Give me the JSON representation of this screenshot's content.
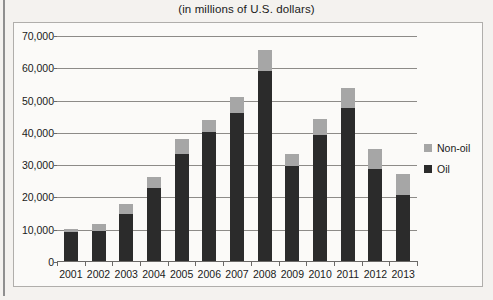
{
  "title": "(in millions of U.S. dollars)",
  "colors": {
    "oil": "#2b2b2b",
    "non_oil": "#a6a6a6",
    "grid": "#8d8b88",
    "axis": "#6b6967",
    "page_background": "#f4f2ef",
    "plot_background": "#fbfaf8",
    "text": "#1a1a1a"
  },
  "legend": {
    "position": "right",
    "items": [
      {
        "label": "Non-oil",
        "color": "#a6a6a6",
        "swatch_icon": "square-swatch-icon"
      },
      {
        "label": "Oil",
        "color": "#2b2b2b",
        "swatch_icon": "square-swatch-icon"
      }
    ]
  },
  "chart_data": {
    "type": "bar",
    "stacked": true,
    "title": "(in millions of U.S. dollars)",
    "xlabel": "",
    "ylabel": "",
    "ylim": [
      0,
      70000
    ],
    "ytick_step": 10000,
    "ytick_labels": [
      "0",
      "10,000",
      "20,000",
      "30,000",
      "40,000",
      "50,000",
      "60,000",
      "70,000"
    ],
    "ytick_values": [
      0,
      10000,
      20000,
      30000,
      40000,
      50000,
      60000,
      70000
    ],
    "grid": true,
    "grid_axis": "y",
    "categories": [
      "2001",
      "2002",
      "2003",
      "2004",
      "2005",
      "2006",
      "2007",
      "2008",
      "2009",
      "2010",
      "2011",
      "2012",
      "2013"
    ],
    "series": [
      {
        "name": "Oil",
        "color": "#2b2b2b",
        "values": [
          9000,
          9300,
          14500,
          22500,
          33000,
          40000,
          46000,
          59000,
          29500,
          39000,
          47500,
          28500,
          20500
        ]
      },
      {
        "name": "Non-oil",
        "color": "#a6a6a6",
        "values": [
          1000,
          2200,
          3200,
          3500,
          4700,
          3800,
          4700,
          6500,
          3500,
          5000,
          6000,
          6200,
          6500
        ]
      }
    ],
    "totals": [
      10000,
      11500,
      17700,
      26000,
      37700,
      43800,
      50700,
      65500,
      33000,
      44000,
      53500,
      34700,
      27000
    ]
  }
}
